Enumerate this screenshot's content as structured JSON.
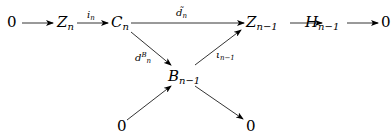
{
  "diagram": {
    "type": "commutative-diagram",
    "nodes": {
      "zero_left": {
        "base": "0",
        "sub": ""
      },
      "Z_n": {
        "base": "Z",
        "sub": "n"
      },
      "C_n": {
        "base": "C",
        "sub": "n"
      },
      "Z_n_1": {
        "base": "Z",
        "sub": "n−1"
      },
      "H_n_1": {
        "base": "H",
        "sub": "n−1"
      },
      "zero_right": {
        "base": "0",
        "sub": ""
      },
      "B_n_1": {
        "base": "B",
        "sub": "n−1"
      },
      "zero_bottom_left": {
        "base": "0",
        "sub": ""
      },
      "zero_bottom_right": {
        "base": "0",
        "sub": ""
      }
    },
    "arrows": {
      "i_n": {
        "base": "i",
        "sub": "n",
        "from": "Z_n",
        "to": "C_n"
      },
      "d_tilde_n": {
        "base": "d̃",
        "sub": "n",
        "from": "C_n",
        "to": "Z_n_1"
      },
      "d_n_B": {
        "base": "d",
        "sub": "n",
        "sup": "B",
        "from": "C_n",
        "to": "B_n_1"
      },
      "iota_n_1": {
        "base": "ι",
        "sub": "n−1",
        "from": "B_n_1",
        "to": "Z_n_1"
      },
      "zero_to_Zn": {
        "from": "zero_left",
        "to": "Z_n"
      },
      "Zn1_to_Hn1": {
        "from": "Z_n_1",
        "to": "H_n_1"
      },
      "Hn1_to_zero": {
        "from": "H_n_1",
        "to": "zero_right"
      },
      "zero_to_Bn1": {
        "from": "zero_bottom_left",
        "to": "B_n_1"
      },
      "Bn1_to_zero": {
        "from": "B_n_1",
        "to": "zero_bottom_right"
      }
    }
  }
}
